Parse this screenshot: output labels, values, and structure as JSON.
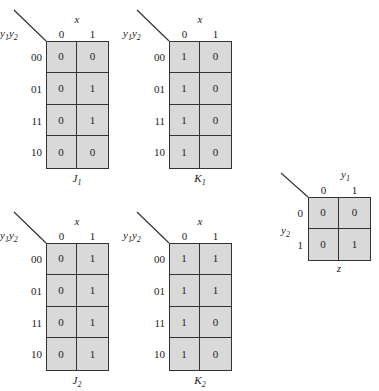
{
  "kmaps": [
    {
      "id": "J1",
      "name": "J",
      "sub": "1",
      "col_var": "x",
      "row_var_a": "y",
      "row_sub_a": "1",
      "row_var_b": "y",
      "row_sub_b": "2",
      "col_labels": [
        "0",
        "1"
      ],
      "row_labels": [
        "00",
        "01",
        "11",
        "10"
      ],
      "cells": [
        [
          "0",
          "0"
        ],
        [
          "0",
          "1"
        ],
        [
          "0",
          "1"
        ],
        [
          "0",
          "0"
        ]
      ]
    },
    {
      "id": "K1",
      "name": "K",
      "sub": "1",
      "col_var": "x",
      "row_var_a": "y",
      "row_sub_a": "1",
      "row_var_b": "y",
      "row_sub_b": "2",
      "col_labels": [
        "0",
        "1"
      ],
      "row_labels": [
        "00",
        "01",
        "11",
        "10"
      ],
      "cells": [
        [
          "1",
          "0"
        ],
        [
          "1",
          "0"
        ],
        [
          "1",
          "0"
        ],
        [
          "1",
          "0"
        ]
      ]
    },
    {
      "id": "J2",
      "name": "J",
      "sub": "2",
      "col_var": "x",
      "row_var_a": "y",
      "row_sub_a": "1",
      "row_var_b": "y",
      "row_sub_b": "2",
      "col_labels": [
        "0",
        "1"
      ],
      "row_labels": [
        "00",
        "01",
        "11",
        "10"
      ],
      "cells": [
        [
          "0",
          "1"
        ],
        [
          "0",
          "1"
        ],
        [
          "0",
          "1"
        ],
        [
          "0",
          "1"
        ]
      ]
    },
    {
      "id": "K2",
      "name": "K",
      "sub": "2",
      "col_var": "x",
      "row_var_a": "y",
      "row_sub_a": "1",
      "row_var_b": "y",
      "row_sub_b": "2",
      "col_labels": [
        "0",
        "1"
      ],
      "row_labels": [
        "00",
        "01",
        "11",
        "10"
      ],
      "cells": [
        [
          "1",
          "1"
        ],
        [
          "1",
          "1"
        ],
        [
          "1",
          "0"
        ],
        [
          "1",
          "0"
        ]
      ]
    }
  ],
  "zmap": {
    "name": "z",
    "col_var": "y",
    "col_sub": "1",
    "row_var": "y",
    "row_sub": "2",
    "col_labels": [
      "0",
      "1"
    ],
    "row_labels": [
      "0",
      "1"
    ],
    "cells": [
      [
        "0",
        "0"
      ],
      [
        "0",
        "1"
      ]
    ]
  }
}
